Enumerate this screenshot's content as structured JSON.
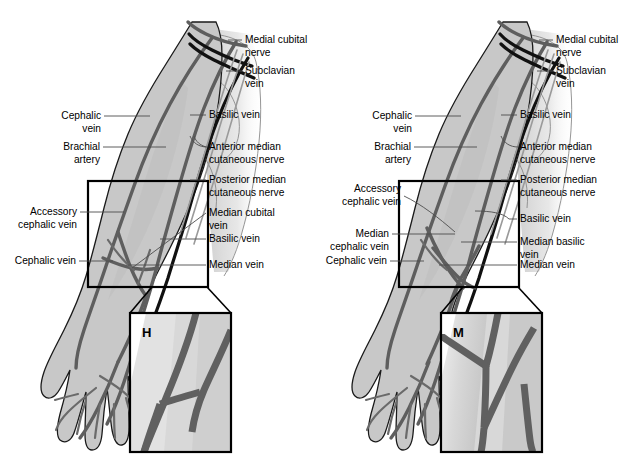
{
  "figure": {
    "background_color": "#ffffff",
    "ink_color": "#000000",
    "skin_fill": "#c8c8c8",
    "vessel_color": "#5e5e5e",
    "nerve_color": "#111111"
  },
  "panels": [
    {
      "id": "left-panel",
      "pattern_letter": "H",
      "pattern_name": "H-pattern",
      "labels_right": [
        {
          "id": "medial-cubital-nerve",
          "lines": [
            "Medial cubital",
            "nerve"
          ]
        },
        {
          "id": "subclavian-vein",
          "lines": [
            "Subclavian",
            "vein"
          ]
        },
        {
          "id": "basilic-vein-upper",
          "lines": [
            "Basilic vein"
          ]
        },
        {
          "id": "anterior-median-cutaneous-nerve",
          "lines": [
            "Anterior median",
            "cutaneous nerve"
          ]
        },
        {
          "id": "posterior-median-cutaneous-nerve",
          "lines": [
            "Posterior median",
            "cutaneous nerve"
          ]
        },
        {
          "id": "median-cubital-vein",
          "lines": [
            "Median cubital",
            "vein"
          ]
        },
        {
          "id": "basilic-vein-lower",
          "lines": [
            "Basilic vein"
          ]
        },
        {
          "id": "median-vein",
          "lines": [
            "Median vein"
          ]
        }
      ],
      "labels_left": [
        {
          "id": "cephalic-vein-upper",
          "lines": [
            "Cephalic",
            "vein"
          ]
        },
        {
          "id": "brachial-artery",
          "lines": [
            "Brachial",
            "artery"
          ]
        },
        {
          "id": "accessory-cephalic-vein",
          "lines": [
            "Accessory",
            "cephalic vein"
          ]
        },
        {
          "id": "cephalic-vein-lower",
          "lines": [
            "Cephalic vein"
          ]
        }
      ]
    },
    {
      "id": "right-panel",
      "pattern_letter": "M",
      "pattern_name": "M-pattern",
      "labels_right": [
        {
          "id": "medial-cubital-nerve",
          "lines": [
            "Medial cubital",
            "nerve"
          ]
        },
        {
          "id": "subclavian-vein",
          "lines": [
            "Subclavian",
            "vein"
          ]
        },
        {
          "id": "basilic-vein-upper",
          "lines": [
            "Basilic vein"
          ]
        },
        {
          "id": "anterior-median-cutaneous-nerve",
          "lines": [
            "Anterior median",
            "cutaneous nerve"
          ]
        },
        {
          "id": "posterior-median-cutaneous-nerve",
          "lines": [
            "Posterior median",
            "cutaneous nerve"
          ]
        },
        {
          "id": "basilic-vein-lower",
          "lines": [
            "Basilic vein"
          ]
        },
        {
          "id": "median-basilic-vein",
          "lines": [
            "Median basilic",
            "vein"
          ]
        },
        {
          "id": "median-vein",
          "lines": [
            "Median vein"
          ]
        }
      ],
      "labels_left": [
        {
          "id": "cephalic-vein-upper",
          "lines": [
            "Cephalic",
            "vein"
          ]
        },
        {
          "id": "brachial-artery",
          "lines": [
            "Brachial",
            "artery"
          ]
        },
        {
          "id": "accessory-cephalic-vein",
          "lines": [
            "Accessory",
            "cephalic vein"
          ]
        },
        {
          "id": "median-cephalic-vein",
          "lines": [
            "Median",
            "cephalic vein"
          ]
        },
        {
          "id": "cephalic-vein-lower",
          "lines": [
            "Cephalic vein"
          ]
        }
      ]
    }
  ]
}
